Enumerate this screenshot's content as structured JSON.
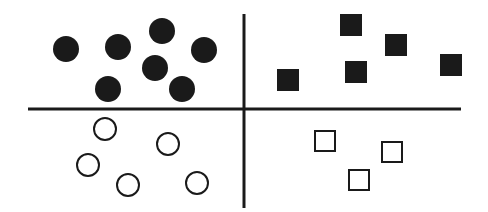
{
  "diagram": {
    "colors": {
      "ink": "#1a1a1a",
      "background": "#ffffff"
    },
    "axes": {
      "horizontal": {
        "x1": 28,
        "y1": 109,
        "x2": 461,
        "y2": 109
      },
      "vertical": {
        "x1": 244,
        "y1": 14,
        "x2": 244,
        "y2": 208
      }
    },
    "quadrants": {
      "top_left": {
        "shape": "circle",
        "fill": "filled",
        "radius": 13,
        "points": [
          [
            66,
            49
          ],
          [
            118,
            47
          ],
          [
            162,
            31
          ],
          [
            204,
            50
          ],
          [
            155,
            68
          ],
          [
            108,
            89
          ],
          [
            182,
            89
          ]
        ]
      },
      "top_right": {
        "shape": "square",
        "fill": "filled",
        "size": 22,
        "points": [
          [
            288,
            80
          ],
          [
            351,
            25
          ],
          [
            396,
            45
          ],
          [
            356,
            72
          ],
          [
            451,
            65
          ]
        ]
      },
      "bottom_left": {
        "shape": "circle",
        "fill": "open",
        "radius": 12,
        "points": [
          [
            105,
            129
          ],
          [
            168,
            144
          ],
          [
            88,
            165
          ],
          [
            128,
            185
          ],
          [
            197,
            183
          ]
        ]
      },
      "bottom_right": {
        "shape": "square",
        "fill": "open",
        "size": 20,
        "points": [
          [
            325,
            141
          ],
          [
            392,
            152
          ],
          [
            359,
            180
          ]
        ]
      }
    }
  }
}
